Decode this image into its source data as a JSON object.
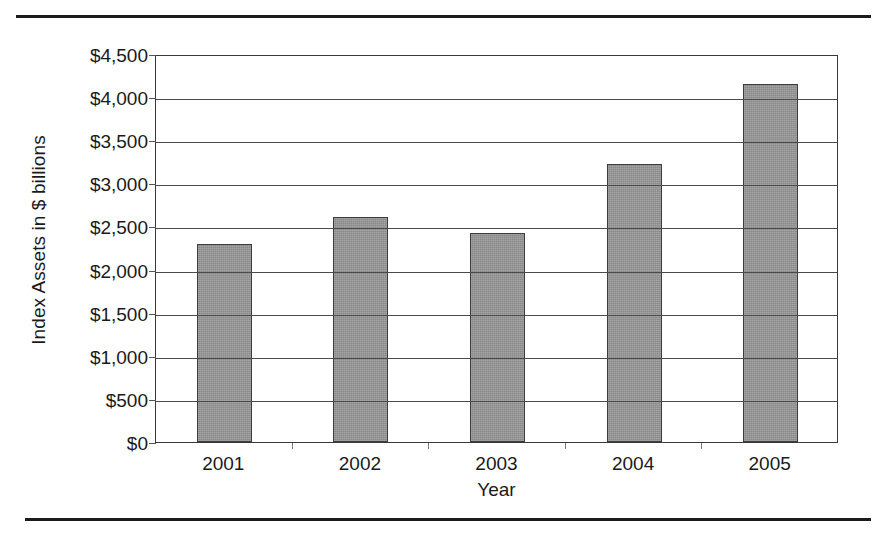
{
  "chart_data": {
    "type": "bar",
    "title": "",
    "subtitle": "",
    "xlabel": "Year",
    "ylabel": "Index Assets in $ billions",
    "categories": [
      "2001",
      "2002",
      "2003",
      "2004",
      "2005"
    ],
    "values": [
      2300,
      2610,
      2420,
      3220,
      4150
    ],
    "series": [
      {
        "name": "Index Assets",
        "values": [
          2300,
          2610,
          2420,
          3220,
          4150
        ]
      }
    ],
    "ylim": [
      0,
      4500
    ],
    "ytick_values": [
      0,
      500,
      1000,
      1500,
      2000,
      2500,
      3000,
      3500,
      4000,
      4500
    ],
    "ytick_labels": [
      "$0",
      "$500",
      "$1,000",
      "$1,500",
      "$2,000",
      "$2,500",
      "$3,000",
      "$3,500",
      "$4,000",
      "$4,500"
    ],
    "xtick_labels": [
      "2001",
      "2002",
      "2003",
      "2004",
      "2005"
    ],
    "grid": "horizontal",
    "legend": "none",
    "bar_color": "#979797",
    "bar_edge_color": "#3c3c3c",
    "axis_color": "#3a3a3a",
    "gridline_color": "#4a4a4a",
    "text_color": "#1a1a1a",
    "background_color": "#ffffff",
    "annotations": []
  },
  "decorations": {
    "top_rule_color": "#1c1c1c",
    "bottom_rule_color": "#1c1c1c"
  }
}
